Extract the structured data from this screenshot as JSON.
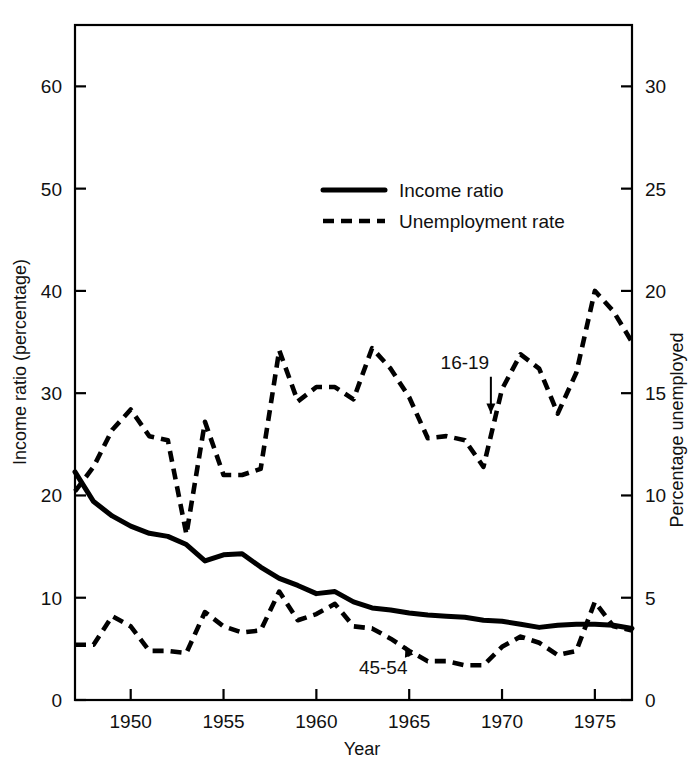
{
  "chart_data": {
    "type": "line",
    "title": "",
    "xlabel": "Year",
    "ylabel": "Income ratio (percentage)",
    "ylabel_right": "Percentage unemployed",
    "xlim": [
      1947,
      1977
    ],
    "ylim": [
      0,
      66
    ],
    "ylim_right": [
      0,
      33
    ],
    "grid": false,
    "legend_position": "upper-center",
    "xticks": [
      1950,
      1955,
      1960,
      1965,
      1970,
      1975
    ],
    "xticklabels": [
      "1950",
      "1955",
      "1960",
      "1965",
      "1970",
      "1975"
    ],
    "yticks_left": [
      0,
      10,
      20,
      30,
      40,
      50,
      60
    ],
    "yticklabels_left": [
      "0",
      "10",
      "20",
      "30",
      "40",
      "50",
      "60"
    ],
    "yticks_right": [
      0,
      5,
      10,
      15,
      20,
      25,
      30
    ],
    "yticklabels_right": [
      "0",
      "5",
      "10",
      "15",
      "20",
      "25",
      "30"
    ],
    "legend": [
      {
        "label": "Income ratio",
        "style": "solid"
      },
      {
        "label": "Unemployment rate",
        "style": "dashed"
      }
    ],
    "annotations": [
      {
        "text": "16-19",
        "x": 1968.0,
        "y_right": 16.2,
        "points_to_x": 1969.4,
        "points_to_y_right": 14.0
      },
      {
        "text": "45-54",
        "x": 1963.6,
        "y_right": 1.25,
        "points_to_x": 1964.8,
        "points_to_y_right": 2.6
      }
    ],
    "x": [
      1947,
      1948,
      1949,
      1950,
      1951,
      1952,
      1953,
      1954,
      1955,
      1956,
      1957,
      1958,
      1959,
      1960,
      1961,
      1962,
      1963,
      1964,
      1965,
      1966,
      1967,
      1968,
      1969,
      1970,
      1971,
      1972,
      1973,
      1974,
      1975,
      1976,
      1977
    ],
    "series": [
      {
        "name": "Income ratio",
        "style": "solid",
        "axis": "left",
        "units": "percentage",
        "values": [
          22.3,
          19.4,
          18.0,
          17.0,
          16.3,
          16.0,
          15.2,
          13.6,
          14.2,
          14.3,
          13.0,
          11.9,
          11.2,
          10.4,
          10.6,
          9.6,
          9.0,
          8.8,
          8.5,
          8.3,
          8.2,
          8.1,
          7.8,
          7.7,
          7.4,
          7.1,
          7.3,
          7.4,
          7.4,
          7.3,
          7.0
        ]
      },
      {
        "name": "Unemployment rate, ages 16-19",
        "style": "dashed",
        "axis": "right",
        "units": "percent unemployed",
        "values": [
          10.2,
          11.4,
          13.2,
          14.2,
          12.9,
          12.7,
          8.1,
          13.6,
          11.0,
          11.0,
          11.3,
          17.1,
          14.6,
          15.3,
          15.3,
          14.7,
          17.2,
          16.2,
          14.8,
          12.8,
          12.9,
          12.7,
          11.4,
          15.2,
          16.9,
          16.2,
          14.0,
          16.0,
          20.0,
          19.0,
          17.5
        ]
      },
      {
        "name": "Unemployment rate, ages 45-54",
        "style": "dashed",
        "axis": "right",
        "units": "percent unemployed",
        "values": [
          2.7,
          2.7,
          4.1,
          3.6,
          2.4,
          2.4,
          2.3,
          4.3,
          3.6,
          3.3,
          3.4,
          5.3,
          3.9,
          4.2,
          4.7,
          3.6,
          3.5,
          3.0,
          2.4,
          1.9,
          1.9,
          1.7,
          1.7,
          2.6,
          3.1,
          2.8,
          2.2,
          2.4,
          4.8,
          3.6,
          3.4
        ]
      }
    ]
  },
  "axis_titles": {
    "left": "Income ratio (percentage)",
    "right": "Percentage unemployed",
    "bottom": "Year"
  }
}
